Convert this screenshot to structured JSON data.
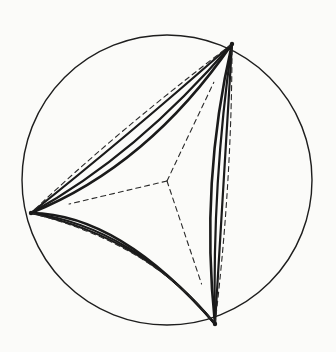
{
  "figure": {
    "caption": "",
    "background_color": "#fbfbf9",
    "ink_color": "#1a1a1a",
    "dash_color": "#2a2a2a",
    "canvas": {
      "width": 336,
      "height": 352
    }
  },
  "chart_data": {
    "type": "scatter",
    "xlabel": "",
    "ylabel": "",
    "grid": false,
    "legend": "none",
    "xlim": [
      0,
      336
    ],
    "ylim": [
      0,
      352
    ],
    "boundary_circle": {
      "label": "Poincare disk boundary",
      "center_x": 167,
      "center_y": 180,
      "radius": 145,
      "stroke_width": 1.4
    },
    "ideal_vertices": [
      {
        "name": "top-vertex",
        "x": 232,
        "y": 44
      },
      {
        "name": "left-vertex",
        "x": 31,
        "y": 213
      },
      {
        "name": "bottom-vertex",
        "x": 215,
        "y": 324
      }
    ],
    "incenter": {
      "name": "incenter",
      "x": 167,
      "y": 181
    },
    "series": [
      {
        "name": "outer-triangle-geodesics",
        "style": "solid",
        "stroke_width": 2.6,
        "edges": [
          {
            "from": "top-vertex",
            "to": "left-vertex",
            "cx": 148,
            "cy": 166
          },
          {
            "from": "left-vertex",
            "to": "bottom-vertex",
            "cx": 120,
            "cy": 214
          },
          {
            "from": "bottom-vertex",
            "to": "top-vertex",
            "cx": 200,
            "cy": 182
          }
        ]
      },
      {
        "name": "middle-equidistant-curves",
        "style": "solid",
        "stroke_width": 2.2,
        "edges": [
          {
            "from": "top-vertex",
            "to": "left-vertex",
            "cx": 137,
            "cy": 155
          },
          {
            "from": "left-vertex",
            "to": "bottom-vertex",
            "cx": 133,
            "cy": 227
          },
          {
            "from": "bottom-vertex",
            "to": "top-vertex",
            "cx": 212,
            "cy": 182
          }
        ]
      },
      {
        "name": "inner-equidistant-curves",
        "style": "solid",
        "stroke_width": 2.2,
        "edges": [
          {
            "from": "top-vertex",
            "to": "left-vertex",
            "cx": 123,
            "cy": 140
          },
          {
            "from": "left-vertex",
            "to": "bottom-vertex",
            "cx": 146,
            "cy": 238
          },
          {
            "from": "bottom-vertex",
            "to": "top-vertex",
            "cx": 224,
            "cy": 182
          }
        ]
      },
      {
        "name": "innermost-curvy-triangle",
        "style": "dashed",
        "stroke_width": 1.1,
        "dash_pattern": "5 4",
        "edges": [
          {
            "from": "top-vertex",
            "to": "left-vertex",
            "cx": 116,
            "cy": 132
          },
          {
            "from": "left-vertex",
            "to": "bottom-vertex",
            "cx": 152,
            "cy": 244
          },
          {
            "from": "bottom-vertex",
            "to": "top-vertex",
            "cx": 232,
            "cy": 182
          }
        ]
      },
      {
        "name": "dashed-angle-bisectors",
        "style": "dashed",
        "stroke_width": 1.1,
        "dash_pattern": "5 4",
        "spokes": [
          {
            "from": "incenter",
            "to": "top-vertex"
          },
          {
            "from": "incenter",
            "to": "left-vertex"
          },
          {
            "from": "incenter",
            "to": "bottom-vertex"
          }
        ]
      }
    ]
  }
}
